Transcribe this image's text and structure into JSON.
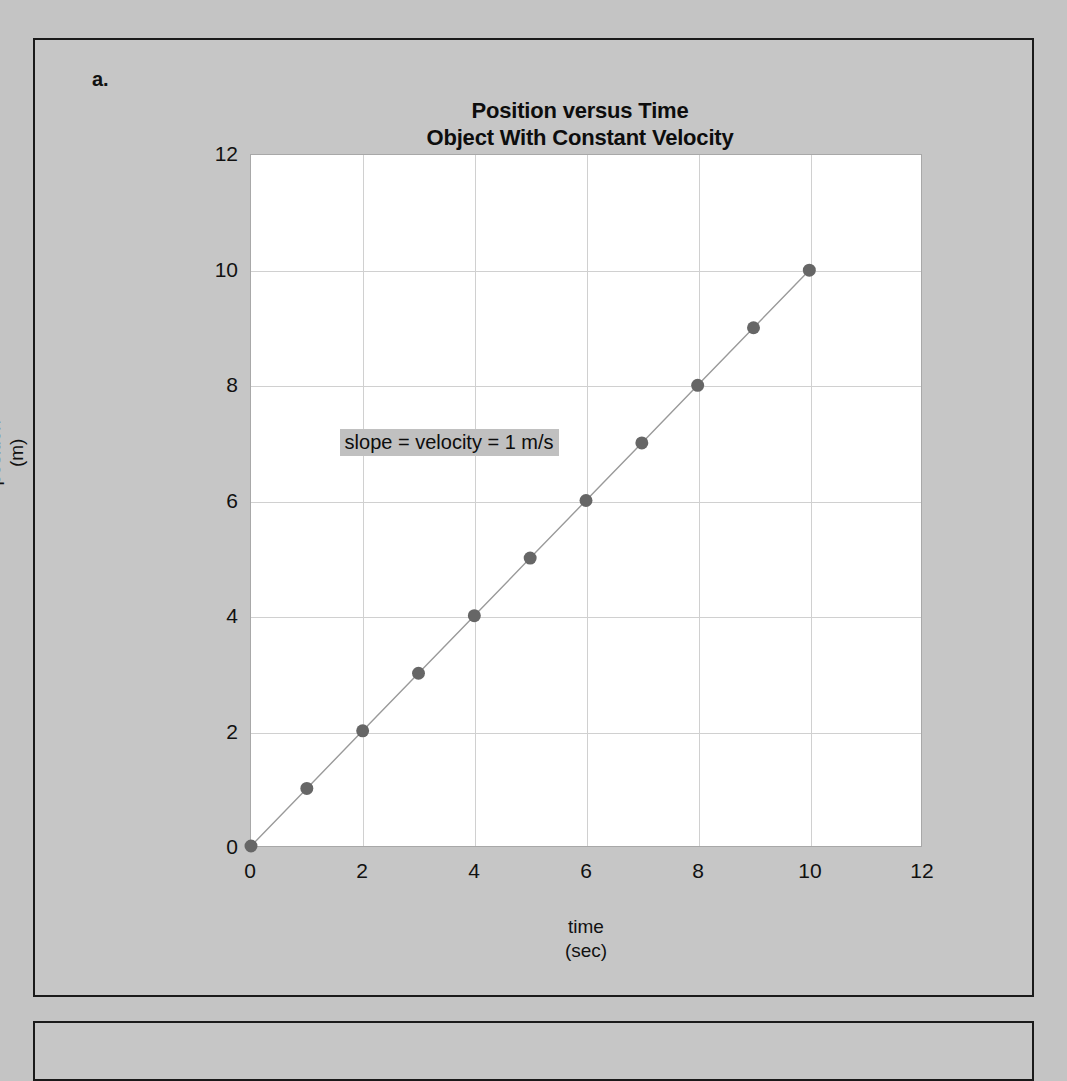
{
  "figure": {
    "part_label": "a.",
    "title_line1": "Position versus Time",
    "title_line2": "Object With Constant Velocity"
  },
  "chart_data": {
    "type": "line",
    "title": "Position versus Time Object With Constant Velocity",
    "xlabel": "time (sec)",
    "ylabel": "position (m)",
    "xlabel_line1": "time",
    "xlabel_line2": "(sec)",
    "ylabel_line1": "position",
    "ylabel_line2": "(m)",
    "xlim": [
      0,
      12
    ],
    "ylim": [
      0,
      12
    ],
    "xticks": [
      0,
      2,
      4,
      6,
      8,
      10,
      12
    ],
    "yticks": [
      0,
      2,
      4,
      6,
      8,
      10,
      12
    ],
    "xtick_labels": [
      "0",
      "2",
      "4",
      "6",
      "8",
      "10",
      "12"
    ],
    "ytick_labels": [
      "0",
      "2",
      "4",
      "6",
      "8",
      "10",
      "12"
    ],
    "grid": true,
    "legend": false,
    "marker": "circle",
    "marker_color": "#666666",
    "line_color": "#9a9a9a",
    "series": [
      {
        "name": "position",
        "x": [
          0,
          1,
          2,
          3,
          4,
          5,
          6,
          7,
          8,
          9,
          10
        ],
        "y": [
          0,
          1,
          2,
          3,
          4,
          5,
          6,
          7,
          8,
          9,
          10
        ]
      }
    ],
    "annotations": [
      {
        "text": "slope = velocity = 1 m/s",
        "x": 1.6,
        "y": 7.0,
        "background": "#c0c0c0"
      }
    ]
  },
  "colors": {
    "page_background": "#c4c4c4",
    "panel_background": "#c6c6c6",
    "panel_border": "#1a1a1a",
    "plot_background": "#ffffff",
    "gridline": "#d0d0d0",
    "text": "#111111"
  }
}
